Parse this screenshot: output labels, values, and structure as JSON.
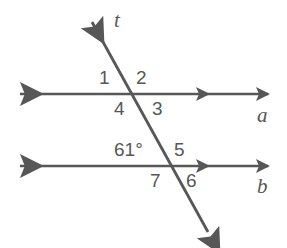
{
  "figure": {
    "stroke_color": "#575757",
    "text_color": "#575757",
    "background_color": "#ffffff",
    "lines": {
      "line_a_label": "a",
      "line_b_label": "b",
      "transversal_label": "t"
    },
    "angle_labels": {
      "n1": "1",
      "n2": "2",
      "n3": "3",
      "n4": "4",
      "n5": "5",
      "n6": "6",
      "n7": "7",
      "measured": "61°"
    }
  }
}
